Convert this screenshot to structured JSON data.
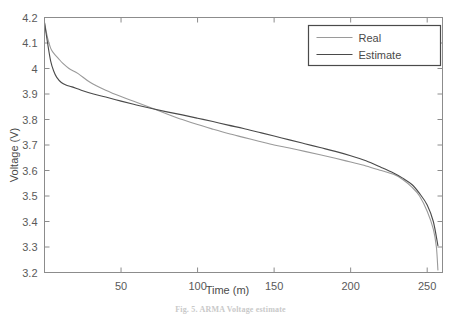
{
  "figure": {
    "caption": "Fig. 5.  ARMA Voltage estimate",
    "background_color": "#ffffff"
  },
  "axes": {
    "x_title": "Time (m)",
    "y_title": "Voltage (V)",
    "x_ticks": [
      "50",
      "100",
      "150",
      "200",
      "250"
    ],
    "y_ticks": [
      "3.2",
      "3.3",
      "3.4",
      "3.5",
      "3.6",
      "3.7",
      "3.8",
      "3.9",
      "4",
      "4.1",
      "4.2"
    ]
  },
  "legend": {
    "position": "top-right",
    "items": [
      {
        "label": "Real",
        "color": "#9a9a9a"
      },
      {
        "label": "Estimate",
        "color": "#4a4a4a"
      }
    ]
  },
  "chart_data": {
    "type": "line",
    "title": "",
    "xlabel": "Time (m)",
    "ylabel": "Voltage (V)",
    "xlim": [
      0,
      260
    ],
    "ylim": [
      3.2,
      4.2
    ],
    "xticks": [
      50,
      100,
      150,
      200,
      250
    ],
    "yticks": [
      3.2,
      3.3,
      3.4,
      3.5,
      3.6,
      3.7,
      3.8,
      3.9,
      4.0,
      4.1,
      4.2
    ],
    "grid": false,
    "legend_position": "upper right",
    "series": [
      {
        "name": "Real",
        "color": "#9a9a9a",
        "x": [
          0,
          2,
          4,
          6,
          9,
          12,
          16,
          22,
          30,
          40,
          50,
          60,
          70,
          80,
          90,
          100,
          110,
          120,
          130,
          140,
          150,
          160,
          170,
          180,
          190,
          200,
          210,
          220,
          228,
          234,
          240,
          245,
          250,
          254,
          256,
          257
        ],
        "y": [
          4.18,
          4.12,
          4.08,
          4.06,
          4.04,
          4.02,
          4.0,
          3.98,
          3.945,
          3.915,
          3.89,
          3.868,
          3.845,
          3.822,
          3.8,
          3.78,
          3.762,
          3.745,
          3.73,
          3.715,
          3.7,
          3.688,
          3.675,
          3.662,
          3.648,
          3.633,
          3.618,
          3.6,
          3.585,
          3.565,
          3.535,
          3.5,
          3.44,
          3.37,
          3.3,
          3.21
        ]
      },
      {
        "name": "Estimate",
        "color": "#4a4a4a",
        "x": [
          0,
          2,
          4,
          6,
          8,
          11,
          14,
          18,
          24,
          32,
          40,
          50,
          60,
          70,
          80,
          90,
          100,
          110,
          120,
          130,
          140,
          150,
          160,
          170,
          180,
          190,
          200,
          210,
          220,
          228,
          234,
          240,
          245,
          250,
          254,
          257
        ],
        "y": [
          4.18,
          4.1,
          4.03,
          3.99,
          3.965,
          3.945,
          3.935,
          3.928,
          3.915,
          3.9,
          3.888,
          3.872,
          3.857,
          3.843,
          3.83,
          3.818,
          3.805,
          3.792,
          3.778,
          3.765,
          3.75,
          3.735,
          3.72,
          3.705,
          3.69,
          3.675,
          3.658,
          3.638,
          3.612,
          3.59,
          3.57,
          3.545,
          3.51,
          3.465,
          3.4,
          3.305
        ]
      }
    ]
  }
}
